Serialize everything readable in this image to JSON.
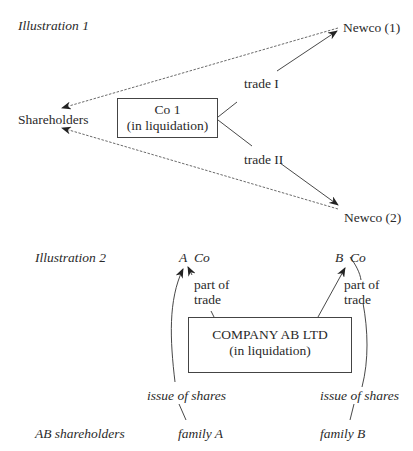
{
  "illustration1": {
    "title": "Illustration 1",
    "shareholders": "Shareholders",
    "company": {
      "name": "Co 1",
      "status": "(in liquidation)"
    },
    "newco1": "Newco (1)",
    "newco2": "Newco (2)",
    "trade1": "trade I",
    "trade2": "trade II",
    "edges": [
      {
        "from": "Co 1",
        "to": "Newco (1)",
        "label": "trade I",
        "style": "solid-arrow"
      },
      {
        "from": "Co 1",
        "to": "Newco (2)",
        "label": "trade II",
        "style": "solid-arrow"
      },
      {
        "from": "Newco (1)",
        "to": "Shareholders",
        "style": "dashed-arrow"
      },
      {
        "from": "Newco (2)",
        "to": "Shareholders",
        "style": "dashed-arrow"
      }
    ]
  },
  "illustration2": {
    "title": "Illustration 2",
    "a_co": {
      "letter": "A",
      "suffix": "Co"
    },
    "b_co": {
      "letter": "B",
      "suffix": "Co"
    },
    "company": {
      "name": "COMPANY AB LTD",
      "status": "(in liquidation)"
    },
    "part_of_trade_left": {
      "line1": "part of",
      "line2": "trade"
    },
    "part_of_trade_right": {
      "line1": "part of",
      "line2": "trade"
    },
    "issue_left": "issue of shares",
    "issue_right": "issue of shares",
    "ab_shareholders": "AB shareholders",
    "family_a": "family A",
    "family_b": "family B",
    "edges": [
      {
        "from": "COMPANY AB LTD",
        "to": "A Co",
        "label": "part of trade",
        "style": "solid-arrow"
      },
      {
        "from": "COMPANY AB LTD",
        "to": "B Co",
        "label": "part of trade",
        "style": "solid-arrow"
      },
      {
        "from": "A Co",
        "to": "family A",
        "label": "issue of shares",
        "style": "curved-line"
      },
      {
        "from": "B Co",
        "to": "family B",
        "label": "issue of shares",
        "style": "curved-line"
      }
    ]
  }
}
